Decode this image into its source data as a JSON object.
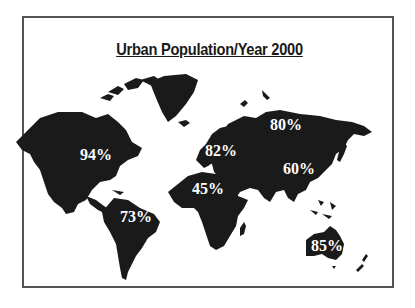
{
  "title": "Urban Population/Year 2000",
  "colors": {
    "land": "#1a1a1a",
    "label": "#ffffff",
    "frame": "#555555"
  },
  "regions": [
    {
      "name": "North America",
      "label": "94%"
    },
    {
      "name": "South America",
      "label": "73%"
    },
    {
      "name": "Europe",
      "label": "82%"
    },
    {
      "name": "Russia",
      "label": "80%"
    },
    {
      "name": "Africa",
      "label": "45%"
    },
    {
      "name": "Asia",
      "label": "60%"
    },
    {
      "name": "Oceania",
      "label": "85%"
    }
  ]
}
